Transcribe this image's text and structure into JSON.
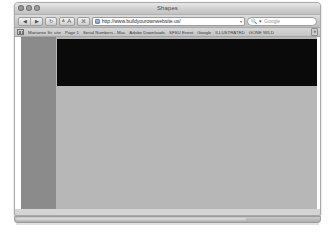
{
  "window": {
    "title": "Shapes",
    "traffic_lights": [
      "close",
      "minimize",
      "zoom"
    ]
  },
  "toolbar": {
    "back_label": "◀",
    "forward_label": "▶",
    "reload_label": "↻",
    "textsize_small_label": "A",
    "textsize_large_label": "A",
    "extra_button_label": "⌘",
    "url_value": "http://www.buildyourownwebsite.us/",
    "url_caret": "▾",
    "search_icon": "🔍",
    "search_caret": "▾",
    "search_placeholder": "Google"
  },
  "bookmarks": {
    "grid_icon": "bookmarks-grid-icon",
    "items": [
      "Marianne Sr. site",
      "Page 1",
      "Serial Numbers - Mac",
      "Adobe Downloads",
      "SFSU Event",
      "Google",
      "ILLUSTRATED",
      "GONE WILD"
    ],
    "overflow_label": "»"
  },
  "page": {
    "sidebar_color": "#8b8b8b",
    "body_color": "#b7b7b7",
    "banner_color": "#0a0a0a"
  },
  "scrollbar": {
    "orientation": "horizontal",
    "thumb_position": "left"
  }
}
